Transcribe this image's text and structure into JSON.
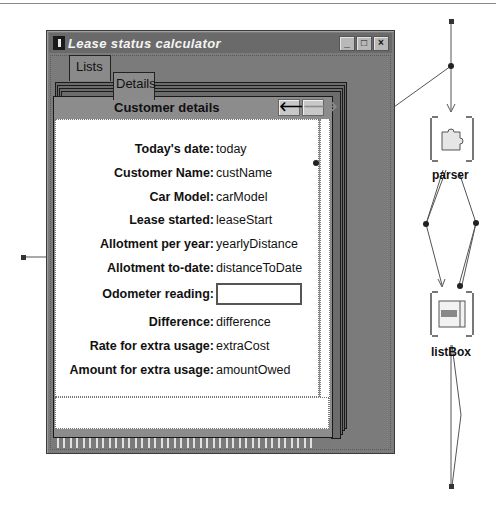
{
  "window": {
    "title": "Lease status calculator",
    "controls": {
      "minimize": "_",
      "maximize": "□",
      "close": "×"
    }
  },
  "tabs": [
    {
      "label": "Lists",
      "active": false
    },
    {
      "label": "Details",
      "active": true
    }
  ],
  "page": {
    "title": "Customer details",
    "nav": {
      "back": "🡐",
      "forward": "🡒"
    },
    "fields": [
      {
        "label": "Today's date:",
        "value": "today"
      },
      {
        "label": "Customer Name:",
        "value": "custName"
      },
      {
        "label": "Car Model:",
        "value": "carModel"
      },
      {
        "label": "Lease started:",
        "value": "leaseStart"
      },
      {
        "label": "Allotment per year:",
        "value": "yearlyDistance"
      },
      {
        "label": "Allotment to-date:",
        "value": "distanceToDate"
      },
      {
        "label": "Odometer reading:",
        "value": "",
        "input": true
      },
      {
        "label": "Difference:",
        "value": "difference"
      },
      {
        "label": "Rate for extra usage:",
        "value": "extraCost"
      },
      {
        "label": "Amount for extra usage:",
        "value": "amountOwed"
      }
    ]
  },
  "diagram": {
    "nodes": [
      {
        "label": "parser",
        "icon": "puzzle-piece-icon"
      },
      {
        "label": "listBox",
        "icon": "listbox-icon"
      }
    ]
  }
}
